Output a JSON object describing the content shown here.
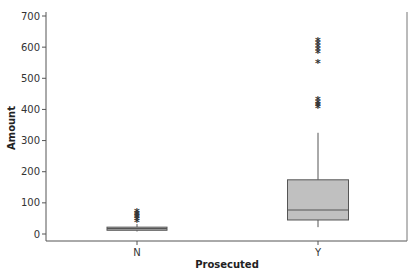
{
  "chart_data": {
    "type": "boxplot",
    "title": "",
    "xlabel": "Prosecuted",
    "ylabel": "Amount",
    "ylim": [
      -30,
      710
    ],
    "yticks": [
      0,
      100,
      200,
      300,
      400,
      500,
      600,
      700
    ],
    "grid": false,
    "legend": null,
    "categories": [
      "N",
      "Y"
    ],
    "groups": [
      {
        "name": "N",
        "whisker_low": 8,
        "q1": 12,
        "median": 17,
        "q3": 22,
        "whisker_high": 32,
        "outliers": [
          40,
          45,
          50,
          55,
          60,
          65,
          70
        ]
      },
      {
        "name": "Y",
        "whisker_low": 22,
        "q1": 45,
        "median": 77,
        "q3": 174,
        "whisker_high": 325,
        "outliers": [
          405,
          410,
          415,
          420,
          430,
          550,
          580,
          590,
          600,
          610,
          620
        ]
      }
    ],
    "colors": {
      "box_fill": "#c0c0c0",
      "box_stroke": "#555555",
      "whisker": "#555555",
      "outlier": "#333333",
      "axis": "#555555"
    }
  }
}
